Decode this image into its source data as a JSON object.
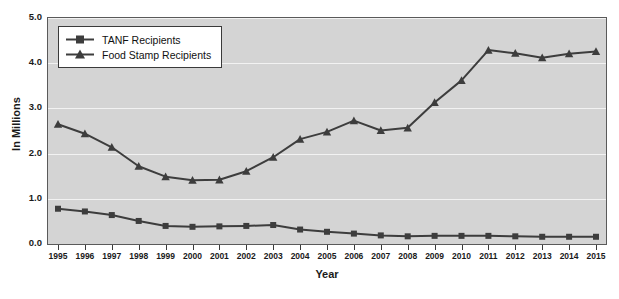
{
  "chart_data": {
    "type": "line",
    "title": "",
    "xlabel": "Year",
    "ylabel": "In Millions",
    "categories": [
      "1995",
      "1996",
      "1997",
      "1998",
      "1999",
      "2000",
      "2001",
      "2002",
      "2003",
      "2004",
      "2005",
      "2006",
      "2007",
      "2008",
      "2009",
      "2010",
      "2011",
      "2012",
      "2013",
      "2014",
      "2015"
    ],
    "ylim": [
      0.0,
      5.0
    ],
    "ytick_labels": [
      "0.0",
      "1.0",
      "2.0",
      "3.0",
      "4.0",
      "5.0"
    ],
    "ytick_values": [
      0.0,
      1.0,
      2.0,
      3.0,
      4.0,
      5.0
    ],
    "grid": true,
    "legend_position": "top-left",
    "series": [
      {
        "name": "TANF Recipients",
        "marker": "square",
        "color": "#3d3d3d",
        "values": [
          0.78,
          0.72,
          0.64,
          0.51,
          0.4,
          0.38,
          0.39,
          0.4,
          0.42,
          0.32,
          0.27,
          0.23,
          0.19,
          0.17,
          0.18,
          0.18,
          0.18,
          0.17,
          0.16,
          0.16,
          0.16
        ]
      },
      {
        "name": "Food Stamp Recipients",
        "marker": "triangle",
        "color": "#3d3d3d",
        "values": [
          2.65,
          2.44,
          2.14,
          1.72,
          1.49,
          1.41,
          1.42,
          1.61,
          1.92,
          2.32,
          2.48,
          2.73,
          2.51,
          2.57,
          3.13,
          3.62,
          4.29,
          4.22,
          4.12,
          4.21,
          4.26
        ]
      }
    ]
  },
  "legend": {
    "items": [
      {
        "label": "TANF Recipients",
        "marker": "square"
      },
      {
        "label": "Food Stamp Recipients",
        "marker": "triangle"
      }
    ]
  },
  "axes": {
    "y_title": "In Millions",
    "x_title": "Year"
  },
  "colors": {
    "plot_background": "#d4d4d4",
    "page_background": "#ffffff",
    "line": "#3d3d3d",
    "gridline": "#f2f2f2",
    "frame": "#5a5a5a",
    "text": "#1a1a1a"
  }
}
